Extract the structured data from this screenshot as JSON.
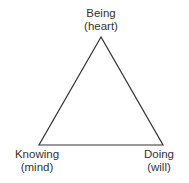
{
  "diagram": {
    "type": "triangle",
    "stroke_color": "#333333",
    "vertices": {
      "top": {
        "title": "Being",
        "subtitle": "(heart)"
      },
      "bottom_left": {
        "title": "Knowing",
        "subtitle": "(mind)"
      },
      "bottom_right": {
        "title": "Doing",
        "subtitle": "(will)"
      }
    }
  }
}
